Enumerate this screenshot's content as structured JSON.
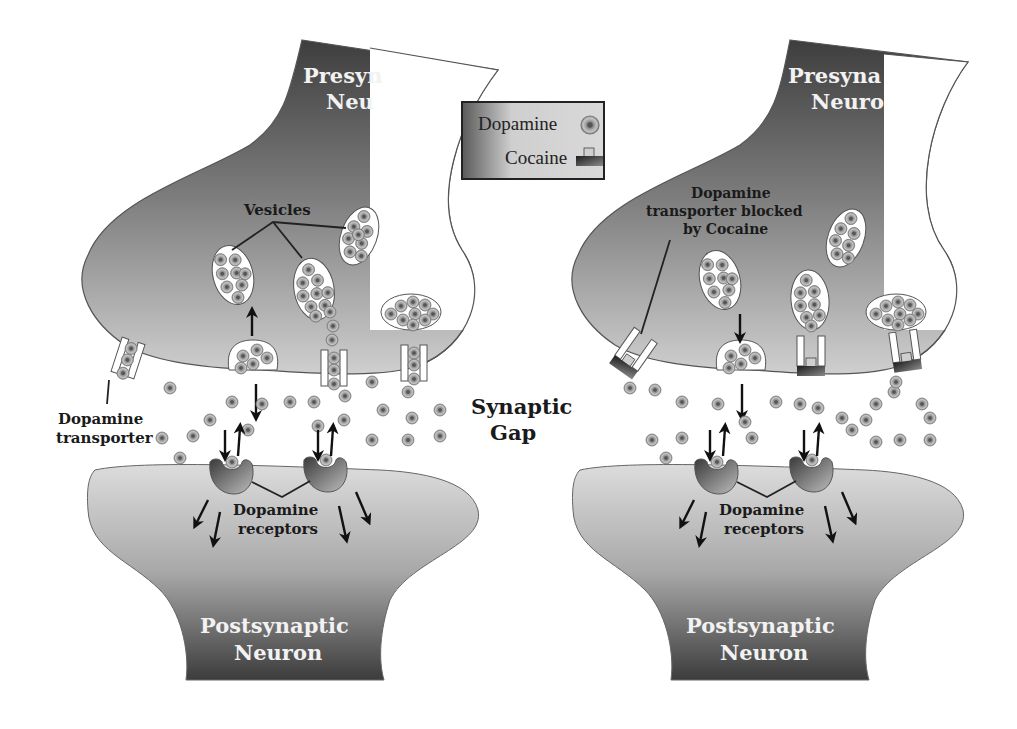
{
  "legend": {
    "items": [
      {
        "label": "Dopamine",
        "icon": "dopamine-molecule-icon"
      },
      {
        "label": "Cocaine",
        "icon": "cocaine-molecule-icon"
      }
    ]
  },
  "center_label": {
    "line1": "Synaptic",
    "line2": "Gap"
  },
  "panels": [
    {
      "id": "normal",
      "presynaptic": {
        "line1": "Presyn",
        "line2": "Neu"
      },
      "postsynaptic": {
        "line1": "Postsynaptic",
        "line2": "Neuron"
      },
      "vesicles_label": "Vesicles",
      "transporter_label": {
        "line1": "Dopamine",
        "line2": "transporter"
      },
      "receptors_label": {
        "line1": "Dopamine",
        "line2": "receptors"
      }
    },
    {
      "id": "cocaine",
      "presynaptic": {
        "line1": "Presyna",
        "line2": "Neuro"
      },
      "postsynaptic": {
        "line1": "Postsynaptic",
        "line2": "Neuron"
      },
      "blocked_label": {
        "line1": "Dopamine",
        "line2": "transporter blocked",
        "line3": "by Cocaine"
      },
      "receptors_label": {
        "line1": "Dopamine",
        "line2": "receptors"
      }
    }
  ],
  "colors": {
    "neuron_dark": "#4a4a4a",
    "neuron_light": "#d8d8d8",
    "dopamine_ring": "#9a9a9a",
    "dopamine_core": "#6a6a6a",
    "cocaine_dark": "#2b2b2b",
    "outline": "#555555"
  },
  "molecules": {
    "left_gap": [
      [
        170,
        388
      ],
      [
        232,
        402
      ],
      [
        262,
        404
      ],
      [
        290,
        402
      ],
      [
        314,
        402
      ],
      [
        345,
        396
      ],
      [
        372,
        382
      ],
      [
        383,
        410
      ],
      [
        408,
        392
      ],
      [
        412,
        418
      ],
      [
        440,
        410
      ],
      [
        162,
        438
      ],
      [
        193,
        436
      ],
      [
        210,
        420
      ],
      [
        248,
        430
      ],
      [
        318,
        426
      ],
      [
        372,
        440
      ],
      [
        408,
        440
      ],
      [
        440,
        436
      ],
      [
        180,
        458
      ],
      [
        344,
        420
      ]
    ],
    "right_gap": [
      [
        630,
        388
      ],
      [
        655,
        390
      ],
      [
        682,
        402
      ],
      [
        718,
        404
      ],
      [
        745,
        422
      ],
      [
        752,
        438
      ],
      [
        776,
        402
      ],
      [
        800,
        404
      ],
      [
        818,
        408
      ],
      [
        842,
        418
      ],
      [
        866,
        420
      ],
      [
        876,
        404
      ],
      [
        894,
        392
      ],
      [
        922,
        404
      ],
      [
        930,
        418
      ],
      [
        652,
        440
      ],
      [
        682,
        438
      ],
      [
        852,
        430
      ],
      [
        876,
        442
      ],
      [
        900,
        440
      ],
      [
        930,
        440
      ],
      [
        666,
        458
      ],
      [
        896,
        382
      ]
    ]
  }
}
